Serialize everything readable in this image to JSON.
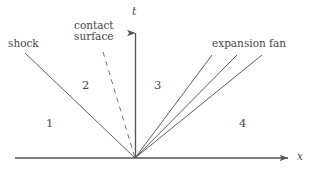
{
  "figure": {
    "type": "riemann-problem-wave-diagram",
    "background_color": "#ffffff",
    "line_color": "#555555",
    "text_color": "#454545"
  },
  "axes": {
    "x_label": "x",
    "t_label": "t",
    "origin": {
      "x": 135,
      "y": 158
    },
    "x_axis": {
      "from_x": 15,
      "to_x": 293,
      "y": 158,
      "arrow": "right"
    },
    "t_axis": {
      "x": 135,
      "from_y": 158,
      "to_y": 28,
      "arrow": "up"
    }
  },
  "annotations": {
    "shock": "shock",
    "contact_surface_line1": "contact",
    "contact_surface_line2": "surface",
    "expansion_fan": "expansion fan"
  },
  "regions": {
    "r1": "1",
    "r2": "2",
    "r3": "3",
    "r4": "4"
  },
  "waves": [
    {
      "name": "shock",
      "style": "solid",
      "from": [
        25,
        53
      ],
      "to": [
        135,
        158
      ]
    },
    {
      "name": "contact-surface",
      "style": "dashed",
      "from": [
        103,
        52
      ],
      "to": [
        135,
        158
      ]
    },
    {
      "name": "expansion-fan-head",
      "style": "solid",
      "from": [
        135,
        158
      ],
      "to": [
        212,
        55
      ]
    },
    {
      "name": "expansion-fan-middle",
      "style": "solid",
      "from": [
        135,
        158
      ],
      "to": [
        237,
        55
      ]
    },
    {
      "name": "expansion-fan-tail",
      "style": "solid",
      "from": [
        135,
        158
      ],
      "to": [
        262,
        55
      ]
    }
  ]
}
